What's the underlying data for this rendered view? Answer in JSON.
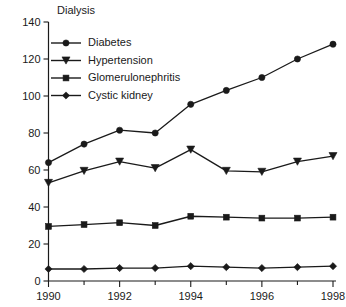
{
  "chart_data": {
    "type": "line",
    "title": "Dialysis",
    "xlabel": "",
    "ylabel": "",
    "grid": false,
    "legend_position": "top-left",
    "x": [
      1990,
      1991,
      1992,
      1993,
      1994,
      1995,
      1996,
      1997,
      1998
    ],
    "xlim": [
      1990,
      1998
    ],
    "ylim": [
      0,
      140
    ],
    "x_tick_labels": [
      "1990",
      "1992",
      "1994",
      "1996",
      "1998"
    ],
    "x_tick_values": [
      1990,
      1992,
      1994,
      1996,
      1998
    ],
    "x_minor_tick_values": [
      1991,
      1993,
      1995,
      1997
    ],
    "y_tick_labels": [
      "0",
      "20",
      "40",
      "60",
      "80",
      "100",
      "120",
      "140"
    ],
    "y_tick_values": [
      0,
      20,
      40,
      60,
      80,
      100,
      120,
      140
    ],
    "series": [
      {
        "name": "Diabetes",
        "marker": "circle",
        "color": "#1a1a1a",
        "values": [
          64,
          74,
          81.5,
          80,
          95.5,
          103,
          110,
          120,
          128
        ]
      },
      {
        "name": "Hypertension",
        "marker": "triangle-down",
        "color": "#1a1a1a",
        "values": [
          53,
          59.5,
          64.5,
          61,
          71,
          59.5,
          59,
          64.5,
          67.5
        ]
      },
      {
        "name": "Glomerulonephritis",
        "marker": "square",
        "color": "#1a1a1a",
        "values": [
          29.5,
          30.5,
          31.5,
          30,
          35,
          34.5,
          34,
          34,
          34.5
        ]
      },
      {
        "name": "Cystic kidney",
        "marker": "diamond",
        "color": "#1a1a1a",
        "values": [
          6.5,
          6.5,
          7,
          7,
          8,
          7.5,
          7,
          7.5,
          8
        ]
      }
    ]
  }
}
